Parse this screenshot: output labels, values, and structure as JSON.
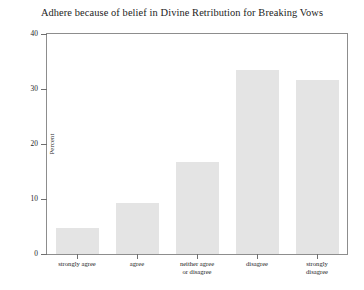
{
  "chart_data": {
    "type": "bar",
    "title": "Adhere because of belief in Divine Retribution for Breaking Vows",
    "xlabel": "",
    "ylabel": "Percent",
    "ylim": [
      0,
      40
    ],
    "yticks": [
      0,
      10,
      20,
      30,
      40
    ],
    "grid": false,
    "legend": null,
    "categories": [
      "strongly agree",
      "agree",
      "neither agree\nor disagree",
      "disagree",
      "strongly\ndisagree"
    ],
    "category_lines": [
      [
        "strongly agree"
      ],
      [
        "agree"
      ],
      [
        "neither agree",
        "or disagree"
      ],
      [
        "disagree"
      ],
      [
        "strongly",
        "disagree"
      ]
    ],
    "values": [
      4.7,
      9.2,
      16.8,
      33.5,
      31.6
    ],
    "bar_color": "#e4e4e4",
    "axis_color": "#8d8d8d"
  }
}
